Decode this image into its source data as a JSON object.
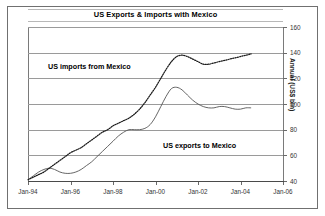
{
  "chart_data": {
    "type": "line",
    "title": "US Exports & Imports with Mexico",
    "xlabel": "",
    "ylabel": "Annual (US$ bln)",
    "ylim": [
      40,
      160
    ],
    "yticks": [
      40,
      60,
      80,
      100,
      120,
      140,
      160
    ],
    "ytick_labels": [
      "40",
      "60",
      "80",
      "100",
      "120",
      "140",
      "160"
    ],
    "xlim": [
      1994.0,
      2006.0
    ],
    "xticks": [
      1994,
      1996,
      1998,
      2000,
      2002,
      2004,
      2006
    ],
    "xtick_labels": [
      "Jan-94",
      "Jan-96",
      "Jan-98",
      "Jan-00",
      "Jan-02",
      "Jan-04",
      "Jan-06"
    ],
    "grid": true,
    "legend_position": "inline-annotations",
    "annotations": [
      {
        "text": "US imports from Mexico",
        "series": "imports"
      },
      {
        "text": "US exports to Mexico",
        "series": "exports"
      }
    ],
    "series": [
      {
        "name": "US imports from Mexico",
        "style": "dotted",
        "color": "#1a1a1a",
        "x": [
          1994.0,
          1994.25,
          1994.5,
          1994.75,
          1995.0,
          1995.25,
          1995.5,
          1995.75,
          1996.0,
          1996.25,
          1996.5,
          1996.75,
          1997.0,
          1997.25,
          1997.5,
          1997.75,
          1998.0,
          1998.25,
          1998.5,
          1998.75,
          1999.0,
          1999.25,
          1999.5,
          1999.75,
          2000.0,
          2000.25,
          2000.5,
          2000.75,
          2001.0,
          2001.25,
          2001.5,
          2001.75,
          2002.0,
          2002.25,
          2002.5,
          2002.75,
          2003.0,
          2003.25,
          2003.5,
          2003.75,
          2004.0,
          2004.25,
          2004.5
        ],
        "values": [
          41,
          43,
          45,
          47,
          50,
          53,
          56,
          59,
          62,
          64,
          66,
          69,
          72,
          75,
          78,
          80,
          83,
          85,
          87,
          89,
          92,
          96,
          101,
          107,
          113,
          120,
          127,
          133,
          137,
          138,
          137,
          135,
          133,
          131,
          131,
          132,
          133,
          134,
          135,
          136,
          137,
          138,
          139
        ]
      },
      {
        "name": "US exports to Mexico",
        "style": "solid",
        "color": "#555555",
        "x": [
          1994.0,
          1994.25,
          1994.5,
          1994.75,
          1995.0,
          1995.25,
          1995.5,
          1995.75,
          1996.0,
          1996.25,
          1996.5,
          1996.75,
          1997.0,
          1997.25,
          1997.5,
          1997.75,
          1998.0,
          1998.25,
          1998.5,
          1998.75,
          1999.0,
          1999.25,
          1999.5,
          1999.75,
          2000.0,
          2000.25,
          2000.5,
          2000.75,
          2001.0,
          2001.25,
          2001.5,
          2001.75,
          2002.0,
          2002.25,
          2002.5,
          2002.75,
          2003.0,
          2003.25,
          2003.5,
          2003.75,
          2004.0,
          2004.25,
          2004.5
        ],
        "values": [
          41,
          44,
          47,
          49,
          50,
          49,
          47,
          46,
          46,
          47,
          49,
          52,
          55,
          59,
          63,
          67,
          71,
          75,
          78,
          80,
          80,
          80,
          81,
          84,
          90,
          98,
          106,
          112,
          113,
          111,
          107,
          103,
          100,
          98,
          97,
          97,
          98,
          98,
          97,
          96,
          96,
          97,
          97
        ]
      }
    ]
  }
}
